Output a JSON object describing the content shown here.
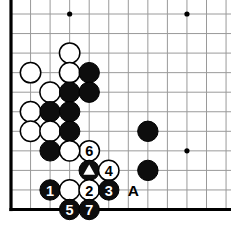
{
  "diagram": {
    "kind": "go-board-diagram",
    "board": {
      "cols": 12,
      "rows": 11,
      "origin_x": 11,
      "origin_y": 14,
      "spacing": 19.55,
      "line_color": "#9a9a9a",
      "line_width": 1,
      "edge_color": "#000000",
      "edge_width": 3.2,
      "background": "#ffffff",
      "left_edge": true,
      "bottom_edge": true,
      "star_points": [
        {
          "col": 3,
          "row": 0
        },
        {
          "col": 9,
          "row": 0
        },
        {
          "col": 9,
          "row": 7
        }
      ]
    },
    "colors": {
      "black": "#0d0d0d",
      "white": "#ffffff",
      "stone_outline": "#000000",
      "label_on_black": "#ffffff",
      "label_on_white": "#000000",
      "grid": "#9a9a9a"
    },
    "stone_radius": 10.2,
    "stones": [
      {
        "id": "w-c3r2",
        "color": "white",
        "col": 3,
        "row": 2,
        "label": "",
        "mark": ""
      },
      {
        "id": "w-c1r3",
        "color": "white",
        "col": 1,
        "row": 3,
        "label": "",
        "mark": ""
      },
      {
        "id": "w-c3r3",
        "color": "white",
        "col": 3,
        "row": 3,
        "label": "",
        "mark": ""
      },
      {
        "id": "b-c4r3",
        "color": "black",
        "col": 4,
        "row": 3,
        "label": "",
        "mark": ""
      },
      {
        "id": "w-c2r4",
        "color": "white",
        "col": 2,
        "row": 4,
        "label": "",
        "mark": ""
      },
      {
        "id": "b-c3r4",
        "color": "black",
        "col": 3,
        "row": 4,
        "label": "",
        "mark": ""
      },
      {
        "id": "b-c4r4",
        "color": "black",
        "col": 4,
        "row": 4,
        "label": "",
        "mark": ""
      },
      {
        "id": "w-c1r5",
        "color": "white",
        "col": 1,
        "row": 5,
        "label": "",
        "mark": ""
      },
      {
        "id": "b-c2r5",
        "color": "black",
        "col": 2,
        "row": 5,
        "label": "",
        "mark": ""
      },
      {
        "id": "b-c3r5",
        "color": "black",
        "col": 3,
        "row": 5,
        "label": "",
        "mark": ""
      },
      {
        "id": "w-c1r6",
        "color": "white",
        "col": 1,
        "row": 6,
        "label": "",
        "mark": ""
      },
      {
        "id": "w-c2r6",
        "color": "white",
        "col": 2,
        "row": 6,
        "label": "",
        "mark": ""
      },
      {
        "id": "b-c3r6",
        "color": "black",
        "col": 3,
        "row": 6,
        "label": "",
        "mark": ""
      },
      {
        "id": "b-c7r6",
        "color": "black",
        "col": 7,
        "row": 6,
        "label": "",
        "mark": ""
      },
      {
        "id": "w-move6",
        "color": "white",
        "col": 4,
        "row": 7,
        "label": "6",
        "mark": ""
      },
      {
        "id": "b-c2r7",
        "color": "black",
        "col": 2,
        "row": 7,
        "label": "",
        "mark": ""
      },
      {
        "id": "w-c3r7",
        "color": "white",
        "col": 3,
        "row": 7,
        "label": "",
        "mark": ""
      },
      {
        "id": "b-triangle",
        "color": "black",
        "col": 4,
        "row": 8,
        "label": "",
        "mark": "triangle"
      },
      {
        "id": "w-move4",
        "color": "white",
        "col": 5,
        "row": 8,
        "label": "4",
        "mark": ""
      },
      {
        "id": "b-c7r8",
        "color": "black",
        "col": 7,
        "row": 8,
        "label": "",
        "mark": ""
      },
      {
        "id": "b-move1",
        "color": "black",
        "col": 2,
        "row": 9,
        "label": "1",
        "mark": ""
      },
      {
        "id": "w-c3r9",
        "color": "white",
        "col": 3,
        "row": 9,
        "label": "",
        "mark": ""
      },
      {
        "id": "w-move2",
        "color": "white",
        "col": 4,
        "row": 9,
        "label": "2",
        "mark": ""
      },
      {
        "id": "b-move3",
        "color": "black",
        "col": 5,
        "row": 9,
        "label": "3",
        "mark": ""
      },
      {
        "id": "b-move5",
        "color": "black",
        "col": 3,
        "row": 10,
        "label": "5",
        "mark": ""
      },
      {
        "id": "b-move7",
        "color": "black",
        "col": 4,
        "row": 10,
        "label": "7",
        "mark": ""
      }
    ],
    "coordinate_labels": [
      {
        "id": "label-A",
        "text": "A",
        "col": 6.26,
        "row": 9
      }
    ],
    "move_sequence": [
      "1",
      "2",
      "3",
      "4",
      "5",
      "6",
      "7"
    ],
    "marked_point": "triangle"
  }
}
